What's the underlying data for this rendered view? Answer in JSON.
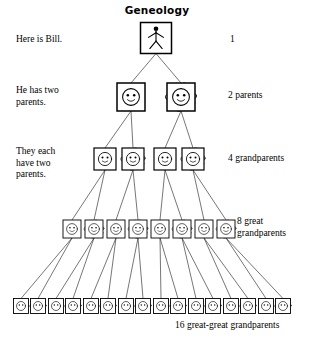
{
  "title": "Geneology",
  "captions": {
    "bill": "Here is Bill.",
    "parents": "He has two\nparents.",
    "grandparents": "They each\nhave two\nparents."
  },
  "counts": {
    "gen1": "1",
    "gen2": "2 parents",
    "gen3": "4 grandparents",
    "gen4": "8 great\ngrandparents",
    "gen5": "16 great-great grandparents"
  },
  "colors": {
    "ink": "#000000",
    "paper": "#ffffff",
    "line": "#1a1a1a"
  },
  "chart_data": {
    "type": "diagram",
    "title": "Geneology",
    "generations": [
      {
        "level": 1,
        "label": "1",
        "count": 1,
        "note": "Here is Bill.",
        "icon": "stick-figure",
        "y": 38,
        "box": 31,
        "nodes": [
          {
            "x": 156,
            "sex": "person"
          }
        ]
      },
      {
        "level": 2,
        "label": "2 parents",
        "count": 2,
        "note": "He has two parents.",
        "icon": "face",
        "y": 97,
        "box": 28,
        "nodes": [
          {
            "x": 131,
            "sex": "male"
          },
          {
            "x": 181,
            "sex": "female"
          }
        ]
      },
      {
        "level": 3,
        "label": "4 grandparents",
        "count": 4,
        "note": "They each have two parents.",
        "icon": "face",
        "y": 159,
        "box": 22,
        "nodes": [
          {
            "x": 105,
            "sex": "male"
          },
          {
            "x": 133,
            "sex": "female"
          },
          {
            "x": 165,
            "sex": "male"
          },
          {
            "x": 193,
            "sex": "female"
          }
        ]
      },
      {
        "level": 4,
        "label": "8 great grandparents",
        "count": 8,
        "icon": "face",
        "y": 229,
        "box": 18,
        "nodes": [
          {
            "x": 72,
            "sex": "male"
          },
          {
            "x": 94,
            "sex": "female"
          },
          {
            "x": 116,
            "sex": "male"
          },
          {
            "x": 138,
            "sex": "female"
          },
          {
            "x": 160,
            "sex": "male"
          },
          {
            "x": 182,
            "sex": "female"
          },
          {
            "x": 204,
            "sex": "male"
          },
          {
            "x": 226,
            "sex": "female"
          }
        ]
      },
      {
        "level": 5,
        "label": "16 great-great grandparents",
        "count": 16,
        "icon": "face",
        "y": 306,
        "box": 15,
        "nodes": [
          {
            "x": 21,
            "sex": "male"
          },
          {
            "x": 38,
            "sex": "female"
          },
          {
            "x": 56,
            "sex": "male"
          },
          {
            "x": 73,
            "sex": "female"
          },
          {
            "x": 91,
            "sex": "male"
          },
          {
            "x": 108,
            "sex": "female"
          },
          {
            "x": 126,
            "sex": "male"
          },
          {
            "x": 143,
            "sex": "female"
          },
          {
            "x": 161,
            "sex": "male"
          },
          {
            "x": 178,
            "sex": "female"
          },
          {
            "x": 196,
            "sex": "male"
          },
          {
            "x": 213,
            "sex": "female"
          },
          {
            "x": 231,
            "sex": "male"
          },
          {
            "x": 248,
            "sex": "female"
          },
          {
            "x": 266,
            "sex": "male"
          },
          {
            "x": 283,
            "sex": "female"
          }
        ]
      }
    ]
  }
}
